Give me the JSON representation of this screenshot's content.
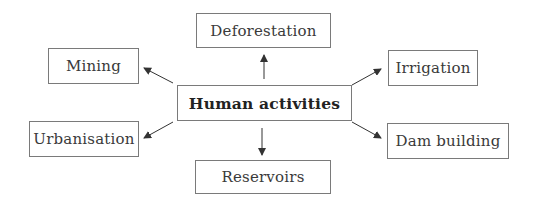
{
  "diagram": {
    "type": "radial-concept-map",
    "center": {
      "label": "Human activities"
    },
    "nodes": [
      {
        "id": "deforestation",
        "label": "Deforestation"
      },
      {
        "id": "irrigation",
        "label": "Irrigation"
      },
      {
        "id": "dam-building",
        "label": "Dam building"
      },
      {
        "id": "reservoirs",
        "label": "Reservoirs"
      },
      {
        "id": "urbanisation",
        "label": "Urbanisation"
      },
      {
        "id": "mining",
        "label": "Mining"
      }
    ],
    "edges": [
      {
        "from": "Human activities",
        "to": "Deforestation"
      },
      {
        "from": "Human activities",
        "to": "Irrigation"
      },
      {
        "from": "Human activities",
        "to": "Dam building"
      },
      {
        "from": "Human activities",
        "to": "Reservoirs"
      },
      {
        "from": "Human activities",
        "to": "Urbanisation"
      },
      {
        "from": "Human activities",
        "to": "Mining"
      }
    ],
    "colors": {
      "border": "#7a7a7a",
      "text": "#3a3a3a",
      "arrow": "#333333",
      "background": "#ffffff"
    }
  }
}
